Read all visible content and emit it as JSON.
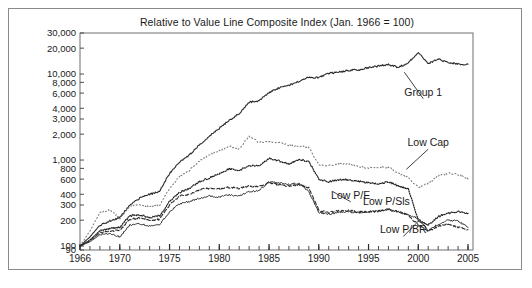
{
  "figure": {
    "title": "Relative to Value Line Composite Index (Jan. 1966 = 100)",
    "caption_faint": "",
    "frame_color": "#8a8a8a",
    "background": "#ffffff"
  },
  "chart_data": {
    "type": "line",
    "title": "Relative to Value Line Composite Index (Jan. 1966 = 100)",
    "xlabel": "",
    "ylabel": "",
    "yscale": "log",
    "ylim": [
      90,
      30000
    ],
    "xlim": [
      1966,
      2005.5
    ],
    "grid": false,
    "legend_position": "inline-annotations",
    "ytick_values": [
      90,
      100,
      200,
      300,
      400,
      600,
      800,
      1000,
      2000,
      3000,
      4000,
      6000,
      8000,
      10000,
      20000,
      30000
    ],
    "ytick_labels": [
      "90",
      "100",
      "200",
      "300",
      "400",
      "600",
      "800",
      "1,000",
      "2,000",
      "3,000",
      "4,000",
      "6,000",
      "8,000",
      "10,000",
      "20,000",
      "30,000"
    ],
    "xtick_values": [
      1966,
      1970,
      1975,
      1980,
      1985,
      1990,
      1995,
      2000,
      2005
    ],
    "xtick_labels": [
      "1966",
      "1970",
      "1975",
      "1980",
      "1985",
      "1990",
      "1995",
      "2000",
      "2005"
    ],
    "xminor_step": 1,
    "x": [
      1966,
      1967,
      1968,
      1969,
      1970,
      1971,
      1972,
      1973,
      1974,
      1975,
      1976,
      1977,
      1978,
      1979,
      1980,
      1981,
      1982,
      1983,
      1984,
      1985,
      1986,
      1987,
      1988,
      1989,
      1990,
      1991,
      1992,
      1993,
      1994,
      1995,
      1996,
      1997,
      1998,
      1999,
      2000,
      2001,
      2002,
      2003,
      2004,
      2005
    ],
    "series": [
      {
        "name": "Group 1",
        "style": "solid",
        "color": "#2b2b2b",
        "width": 1.1,
        "values": [
          100,
          128,
          175,
          196,
          215,
          300,
          360,
          400,
          430,
          700,
          950,
          1150,
          1500,
          1900,
          2350,
          2900,
          3450,
          4700,
          4900,
          6100,
          6900,
          7400,
          8200,
          9200,
          9100,
          10200,
          10500,
          11000,
          11200,
          11900,
          12400,
          12900,
          11900,
          13500,
          18000,
          13200,
          15000,
          13500,
          13100,
          13000
        ]
      },
      {
        "name": "Low Cap",
        "style": "dotted-sparse",
        "color": "#7d7d7d",
        "width": 1.1,
        "values": [
          100,
          150,
          245,
          265,
          210,
          290,
          300,
          290,
          300,
          470,
          640,
          760,
          980,
          1150,
          1280,
          1450,
          1350,
          1900,
          1600,
          1650,
          1600,
          1480,
          1450,
          1400,
          880,
          870,
          900,
          900,
          840,
          810,
          810,
          830,
          700,
          620,
          480,
          540,
          650,
          700,
          680,
          600
        ]
      },
      {
        "name": "Low P/Sls",
        "style": "dotted-dense",
        "color": "#1f1f1f",
        "width": 1.2,
        "values": [
          100,
          118,
          150,
          160,
          165,
          225,
          230,
          215,
          225,
          330,
          420,
          470,
          560,
          620,
          700,
          790,
          760,
          860,
          860,
          1050,
          980,
          900,
          1020,
          960,
          600,
          560,
          590,
          590,
          570,
          540,
          530,
          560,
          500,
          460,
          200,
          175,
          220,
          240,
          250,
          240
        ]
      },
      {
        "name": "Low P/BR",
        "style": "dashed",
        "color": "#2b2b2b",
        "width": 1.1,
        "values": [
          100,
          115,
          142,
          150,
          152,
          205,
          212,
          200,
          205,
          300,
          380,
          400,
          450,
          470,
          460,
          480,
          470,
          500,
          490,
          540,
          520,
          500,
          520,
          480,
          260,
          245,
          255,
          260,
          250,
          250,
          255,
          265,
          250,
          230,
          175,
          150,
          170,
          180,
          165,
          155
        ]
      },
      {
        "name": "Low P/E",
        "style": "solid",
        "color": "#2b2b2b",
        "width": 1.0,
        "values": [
          100,
          112,
          135,
          140,
          128,
          175,
          182,
          172,
          178,
          250,
          310,
          330,
          360,
          380,
          370,
          395,
          380,
          430,
          440,
          560,
          540,
          520,
          540,
          430,
          245,
          235,
          245,
          250,
          245,
          250,
          255,
          270,
          250,
          230,
          210,
          150,
          180,
          200,
          195,
          165
        ]
      }
    ],
    "annotations": [
      {
        "label": "Group 1",
        "x": 2000.5,
        "y": 5600,
        "anchor": "middle",
        "leader": true
      },
      {
        "label": "Low Cap",
        "x": 2001.0,
        "y": 1450,
        "anchor": "middle",
        "leader": true
      },
      {
        "label": "Low P/E",
        "x": 1993.2,
        "y": 355,
        "anchor": "middle",
        "leader": true
      },
      {
        "label": "Low P/Sls",
        "x": 1996.8,
        "y": 300,
        "anchor": "middle",
        "leader": false
      },
      {
        "label": "Low P/BR",
        "x": 1998.5,
        "y": 140,
        "anchor": "middle",
        "leader": true
      }
    ]
  }
}
